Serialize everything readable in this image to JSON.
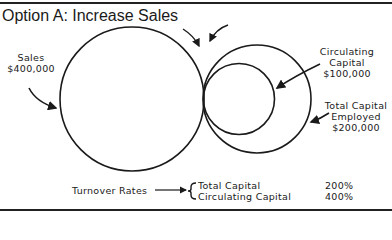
{
  "title": "Option A: Increase Sales",
  "labels": {
    "sales": {
      "line1": "Sales",
      "line2": "$400,000"
    },
    "circulating_capital": {
      "line1": "Circulating",
      "line2": "Capital",
      "line3": "$100,000"
    },
    "total_capital": {
      "line1": "Total Capital",
      "line2": "Employed",
      "line3": "$200,000"
    }
  },
  "turnover": {
    "label": "Turnover Rates",
    "rows": [
      {
        "name": "Total Capital",
        "value": "200%"
      },
      {
        "name": "Circulating Capital",
        "value": "400%"
      }
    ]
  },
  "circles": {
    "sales": {
      "cx": 132,
      "cy": 99,
      "r": 72
    },
    "total_capital": {
      "cx": 257,
      "cy": 99,
      "r": 54
    },
    "circulating_capital": {
      "cx": 239,
      "cy": 99,
      "r": 35
    }
  },
  "colors": {
    "ink": "#1a1a1a",
    "background": "#ffffff"
  }
}
